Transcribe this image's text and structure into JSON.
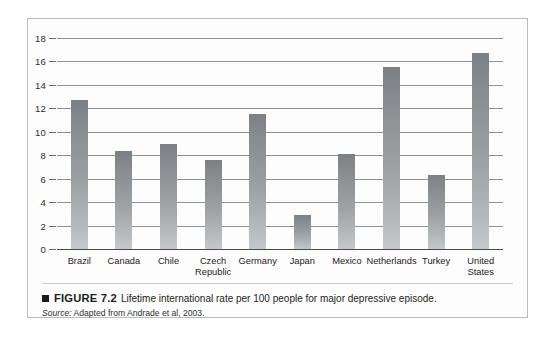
{
  "figure": {
    "bullet_icon": "black-square-icon",
    "figure_label": "FIGURE 7.2",
    "caption": "Lifetime international rate per 100 people for major depressive episode.",
    "source_prefix": "Source:",
    "source_text": "Adapted from Andrade et al, 2003."
  },
  "chart_data": {
    "type": "bar",
    "title": "",
    "xlabel": "",
    "ylabel": "",
    "ylim": [
      0,
      18
    ],
    "ytick_step": 2,
    "grid": true,
    "legend": "none",
    "bar_color": "#9da1a4",
    "categories": [
      "Brazil",
      "Canada",
      "Chile",
      "Czech\nRepublic",
      "Germany",
      "Japan",
      "Mexico",
      "Netherlands",
      "Turkey",
      "United\nStates"
    ],
    "values": [
      12.7,
      8.4,
      9.0,
      7.6,
      11.5,
      2.9,
      8.1,
      15.5,
      6.3,
      16.7
    ],
    "ytick_labels": [
      "0",
      "2",
      "4",
      "6",
      "8",
      "10",
      "12",
      "14",
      "16",
      "18"
    ],
    "ytick_values": [
      0,
      2,
      4,
      6,
      8,
      10,
      12,
      14,
      16,
      18
    ]
  }
}
